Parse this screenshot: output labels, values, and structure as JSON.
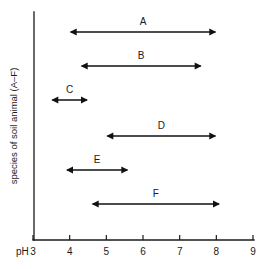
{
  "chart_data": {
    "type": "bar",
    "title": "",
    "subtitle": "",
    "xlabel": "pH",
    "ylabel": "species of soil animal (A–F)",
    "xlim": [
      3,
      9
    ],
    "ylim": [
      0,
      7
    ],
    "grid": false,
    "legend": "none",
    "orientation": "horizontal",
    "note": "Horizontal double-headed range bars showing pH tolerance span of each soil animal species",
    "x_tick_labels": [
      "3",
      "4",
      "5",
      "6",
      "7",
      "8",
      "9"
    ],
    "x_tick_values": [
      3,
      4,
      5,
      6,
      7,
      8,
      9
    ],
    "x_axis_prefix": "pH",
    "categories": [
      "A",
      "B",
      "C",
      "D",
      "E",
      "F"
    ],
    "ranges": [
      {
        "label": "A",
        "min": 4.0,
        "max": 8.0
      },
      {
        "label": "B",
        "min": 4.3,
        "max": 7.6
      },
      {
        "label": "C",
        "min": 3.5,
        "max": 4.5
      },
      {
        "label": "D",
        "min": 5.0,
        "max": 8.0
      },
      {
        "label": "E",
        "min": 3.9,
        "max": 5.6
      },
      {
        "label": "F",
        "min": 4.6,
        "max": 8.1
      }
    ],
    "colors": {
      "axis": "#1a1a1a",
      "range_bar": "#111111",
      "background": "#ffffff"
    }
  }
}
